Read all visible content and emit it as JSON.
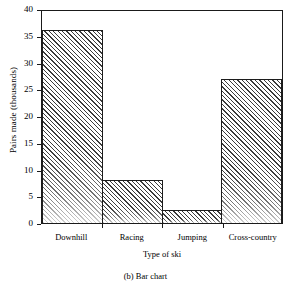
{
  "chart_data": {
    "type": "bar",
    "title": "",
    "caption": "(b)  Bar chart",
    "categories": [
      "Downhill",
      "Racing",
      "Jumping",
      "Cross-country"
    ],
    "values": [
      36,
      8,
      2.5,
      27
    ],
    "xlabel": "Type of ski",
    "ylabel": "Pairs made (thousands)",
    "ylim": [
      0,
      40
    ],
    "ytick_labels": [
      "40",
      "35",
      "30",
      "25",
      "20",
      "15",
      "10",
      "5",
      "0"
    ],
    "ytick_values": [
      40,
      35,
      30,
      25,
      20,
      15,
      10,
      5,
      0
    ],
    "grid": false,
    "legend": null,
    "bar_fill": "#c9c9c9",
    "bar_hatch": "diagonal-45",
    "bar_edge_color": "#1c1c1c",
    "axis_color": "#1a1a1a",
    "background": "#ffffff"
  }
}
